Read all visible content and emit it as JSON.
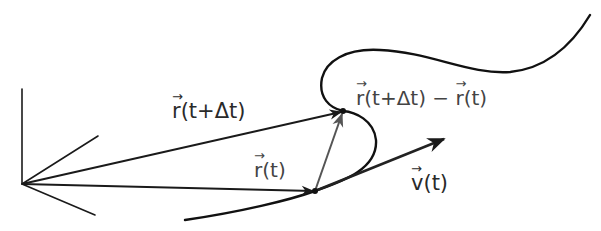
{
  "diagram": {
    "labels": {
      "r_t_plus_dt": {
        "vec": "r",
        "rest": "(t+Δt)"
      },
      "difference": {
        "vec1": "r",
        "mid": "(t+Δt) − ",
        "vec2": "r",
        "rest": "(t)"
      },
      "r_t": {
        "vec": "r",
        "rest": "(t)"
      },
      "v_t": {
        "vec": "v",
        "rest": "(t)"
      }
    },
    "colors": {
      "ink": "#1a1a1a",
      "arrow_gray": "#555555"
    },
    "points": {
      "origin": [
        22,
        184
      ],
      "p_t": [
        315,
        191
      ],
      "p_t_plus_dt": [
        343,
        111
      ],
      "velocity_tip": [
        444,
        139
      ]
    }
  }
}
